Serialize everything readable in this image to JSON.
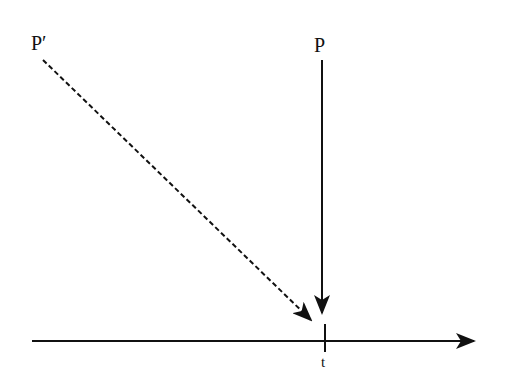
{
  "diagram": {
    "labels": {
      "p_prime": "P′",
      "p": "P",
      "t": "t"
    },
    "elements": [
      {
        "type": "dashed-arrow",
        "from": "P′",
        "to": "t",
        "description": "dashed diagonal arrow from P′ toward point t on the axis"
      },
      {
        "type": "solid-arrow",
        "from": "P",
        "to": "t",
        "description": "solid vertical arrow from P down to point t"
      },
      {
        "type": "axis-arrow",
        "direction": "right",
        "description": "horizontal time axis with tick at t"
      }
    ],
    "colors": {
      "stroke": "#111111",
      "background": "#ffffff"
    }
  }
}
